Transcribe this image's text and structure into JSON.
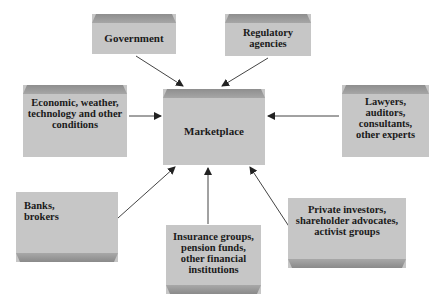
{
  "diagram": {
    "center": {
      "label": "Marketplace"
    },
    "nodes": [
      {
        "id": "government",
        "label": "Government"
      },
      {
        "id": "regulatory",
        "label": "Regulatory\nagencies"
      },
      {
        "id": "economic",
        "label": "Economic, weather,\ntechnology and other\nconditions"
      },
      {
        "id": "lawyers",
        "label": "Lawyers,\nauditors,\nconsultants,\nother experts"
      },
      {
        "id": "banks",
        "label": "Banks,\nbrokers"
      },
      {
        "id": "insurance",
        "label": "Insurance groups,\npension funds,\nother financial\ninstitutions"
      },
      {
        "id": "private",
        "label": "Private investors,\nshareholder advocates,\nactivist groups"
      }
    ],
    "edges": [
      {
        "from": "government",
        "to": "marketplace"
      },
      {
        "from": "regulatory",
        "to": "marketplace"
      },
      {
        "from": "economic",
        "to": "marketplace"
      },
      {
        "from": "lawyers",
        "to": "marketplace"
      },
      {
        "from": "banks",
        "to": "marketplace"
      },
      {
        "from": "insurance",
        "to": "marketplace"
      },
      {
        "from": "private",
        "to": "marketplace"
      }
    ],
    "colors": {
      "box": "#c6c6c6",
      "bevel": "#969696",
      "arrow": "#333333",
      "text": "#1a1a1a"
    }
  }
}
